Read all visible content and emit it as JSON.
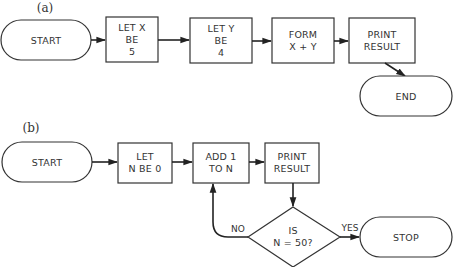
{
  "diagram_a": {
    "panel_label": "(a)",
    "nodes": {
      "start": {
        "label": "START"
      },
      "let_x": {
        "lines": [
          "LET X",
          "BE",
          "5"
        ]
      },
      "let_y": {
        "lines": [
          "LET Y",
          "BE",
          "4"
        ]
      },
      "form": {
        "lines": [
          "FORM",
          "X + Y"
        ]
      },
      "print": {
        "lines": [
          "PRINT",
          "RESULT"
        ]
      },
      "end": {
        "label": "END"
      }
    }
  },
  "diagram_b": {
    "panel_label": "(b)",
    "nodes": {
      "start": {
        "label": "START"
      },
      "let_n": {
        "lines": [
          "LET",
          "N BE 0"
        ]
      },
      "add": {
        "lines": [
          "ADD 1",
          "TO N"
        ]
      },
      "print": {
        "lines": [
          "PRINT",
          "RESULT"
        ]
      },
      "decision": {
        "lines": [
          "IS",
          "N = 50?"
        ]
      },
      "stop": {
        "label": "STOP"
      }
    },
    "edge_labels": {
      "no": "NO",
      "yes": "YES"
    }
  },
  "colors": {
    "stroke": "#333333",
    "text": "#333333",
    "background": "#ffffff"
  }
}
